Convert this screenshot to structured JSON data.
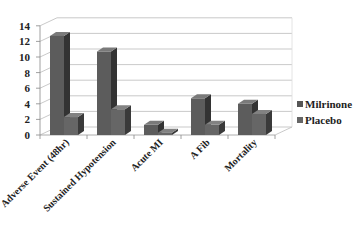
{
  "chart_data": {
    "type": "bar",
    "title": "",
    "xlabel": "",
    "ylabel": "",
    "ylim": [
      0,
      14
    ],
    "yticks": [
      0,
      2,
      4,
      6,
      8,
      10,
      12,
      14
    ],
    "grid": true,
    "legend_position": "right",
    "categories": [
      "Adverse Event (48hr)",
      "Sustained Hypotension",
      "Acute MI",
      "A Fib",
      "Mortality"
    ],
    "series": [
      {
        "name": "Milrinone",
        "values": [
          12.7,
          10.7,
          1.3,
          4.7,
          4.0
        ],
        "color": "#555555"
      },
      {
        "name": "Placebo",
        "values": [
          2.3,
          3.3,
          0.3,
          1.3,
          2.7
        ],
        "color": "#666666"
      }
    ]
  }
}
